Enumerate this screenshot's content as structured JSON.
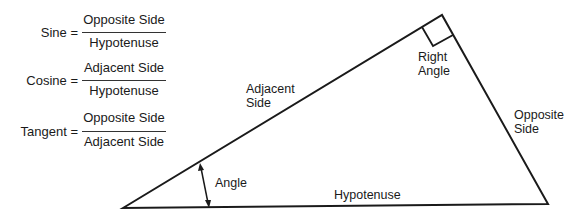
{
  "formulas": [
    {
      "name": "Sine",
      "label": "Sine =",
      "numerator": "Opposite Side",
      "denominator": "Hypotenuse"
    },
    {
      "name": "Cosine",
      "label": "Cosine =",
      "numerator": "Adjacent Side",
      "denominator": "Hypotenuse"
    },
    {
      "name": "Tangent",
      "label": "Tangent =",
      "numerator": "Opposite Side",
      "denominator": "Adjacent Side"
    }
  ],
  "triangle": {
    "labels": {
      "adjacent_line1": "Adjacent",
      "adjacent_line2": "Side",
      "right_angle_line1": "Right",
      "right_angle_line2": "Angle",
      "opposite_line1": "Opposite",
      "opposite_line2": "Side",
      "angle": "Angle",
      "hypotenuse": "Hypotenuse"
    },
    "stroke_color": "#1a1a1a"
  }
}
